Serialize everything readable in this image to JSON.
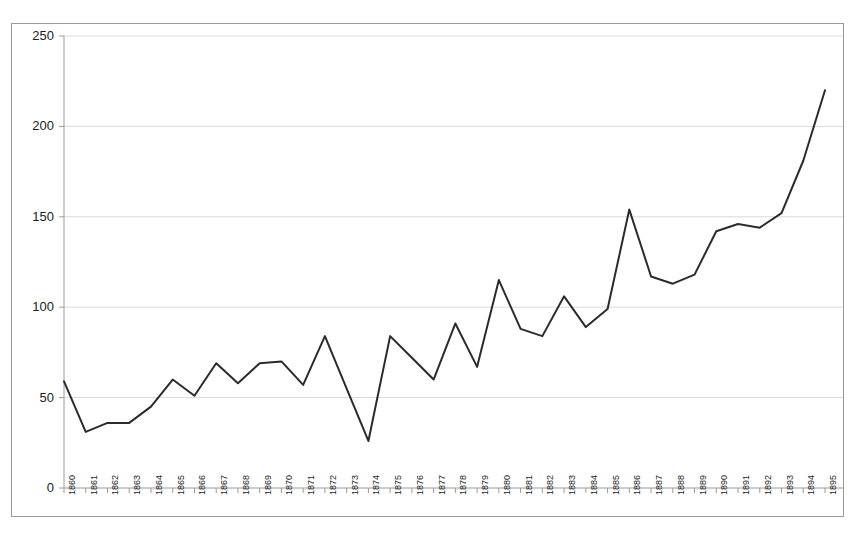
{
  "chart_data": {
    "type": "line",
    "title": "",
    "subtitle": "",
    "xlabel": "",
    "ylabel": "",
    "grid": true,
    "legend": false,
    "legend_position": "none",
    "line_color": "#2b2b2b",
    "grid_color": "#d9d9d9",
    "axis_color": "#9a9a9a",
    "background_color": "#ffffff",
    "xlim": [
      1860,
      1895
    ],
    "ylim": [
      0,
      250
    ],
    "y_ticks": [
      0,
      50,
      100,
      150,
      200,
      250
    ],
    "y_tick_labels": [
      "0",
      "50",
      "100",
      "150",
      "200",
      "250"
    ],
    "categories": [
      "1860",
      "1861",
      "1862",
      "1863",
      "1864",
      "1865",
      "1866",
      "1867",
      "1868",
      "1869",
      "1870",
      "1871",
      "1872",
      "1873",
      "1874",
      "1875",
      "1876",
      "1877",
      "1878",
      "1879",
      "1880",
      "1881",
      "1882",
      "1883",
      "1884",
      "1885",
      "1886",
      "1887",
      "1888",
      "1889",
      "1890",
      "1891",
      "1892",
      "1893",
      "1894",
      "1895"
    ],
    "values": [
      59,
      31,
      36,
      36,
      45,
      60,
      51,
      69,
      58,
      69,
      70,
      57,
      84,
      55,
      26,
      84,
      72,
      60,
      91,
      67,
      115,
      88,
      84,
      106,
      89,
      99,
      154,
      117,
      113,
      118,
      142,
      146,
      144,
      152,
      181,
      220
    ]
  }
}
